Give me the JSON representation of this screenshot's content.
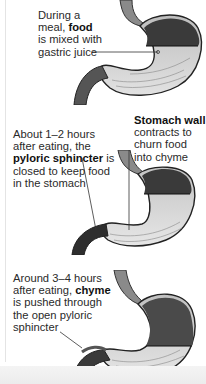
{
  "figure": {
    "panels": [
      {
        "id": "panel-1",
        "label_parts": [
          "During a",
          "meal, ",
          "food",
          "is mixed with",
          "gastric juice"
        ],
        "bold": "food",
        "text": "During a meal, food is mixed with gastric juice"
      },
      {
        "id": "panel-2",
        "label_parts": [
          "About 1–2 hours",
          "after eating, the",
          "pyloric sphincter",
          " is",
          "closed to keep food",
          "in the stomach"
        ],
        "bold": "pyloric sphincter",
        "text": "About 1–2 hours after eating, the pyloric sphincter is closed to keep food in the stomach",
        "secondary_label_parts": [
          "Stomach wall",
          "contracts to",
          "churn food",
          "into chyme"
        ],
        "secondary_bold": "Stomach wall",
        "secondary_text": "Stomach wall contracts to churn food into chyme"
      },
      {
        "id": "panel-3",
        "label_parts": [
          "Around 3–4 hours",
          "after eating, ",
          "chyme",
          "is pushed through",
          "the open pyloric",
          "sphincter"
        ],
        "bold": "chyme",
        "text": "Around 3–4 hours after eating, chyme is pushed through the open pyloric sphincter"
      }
    ],
    "colors": {
      "text": "#2a2a2a",
      "bold_text": "#111111",
      "stomach_fill_light": "#d6d6d6",
      "stomach_fill_dark": "#3a3a3a",
      "leader_line": "#333333",
      "rule": "#e4e4e4"
    }
  }
}
